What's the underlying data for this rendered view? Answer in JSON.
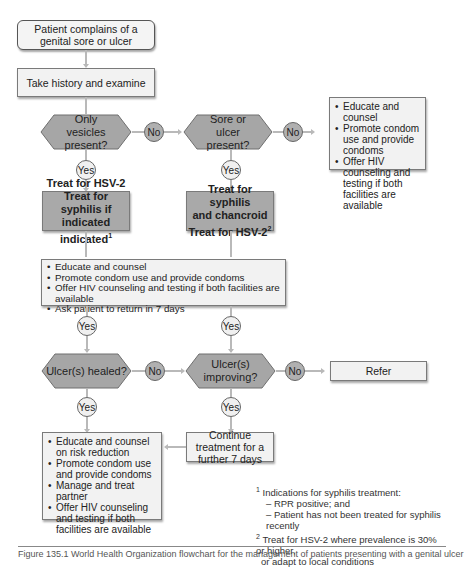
{
  "flowchart": {
    "start": "Patient complains of a genital sore or ulcer",
    "history": "Take history and examine",
    "decision_vesicles": "Only vesicles present?",
    "decision_sore": "Sore or ulcer present?",
    "no_sore_actions": [
      "Educate and counsel",
      "Promote condom use and provide condoms",
      "Offer HIV counseling and testing if both facilities are available"
    ],
    "treat_hsv_lines": [
      "Treat for HSV-2",
      "Treat for syphilis if indicated"
    ],
    "treat_hsv_sup": "1",
    "treat_syph_lines": [
      "Treat for syphilis",
      "and chancroid",
      "Treat for HSV-2"
    ],
    "treat_syph_sup": "2",
    "common_actions": [
      "Educate and counsel",
      "Promote condom use and provide condoms",
      "Offer HIV counseling and testing if both facilities are available",
      "Ask patient to return in 7 days"
    ],
    "decision_healed": "Ulcer(s) healed?",
    "decision_improving": "Ulcer(s) improving?",
    "refer": "Refer",
    "continue": "Continue treatment for a further 7 days",
    "healed_actions": [
      "Educate and counsel on risk reduction",
      "Promote condom use and provide condoms",
      "Manage and treat partner",
      "Offer HIV counseling and testing if both facilities are available"
    ],
    "labels": {
      "yes": "Yes",
      "no": "No"
    }
  },
  "footnotes": {
    "n1_mark": "1",
    "n1_title": "Indications for syphilis treatment:",
    "n1_items": [
      "– RPR positive; and",
      "– Patient has not been treated for syphilis recently"
    ],
    "n2_mark": "2",
    "n2_line1": "Treat for HSV-2 where prevalence is 30% or higher,",
    "n2_line2": "or adapt to local conditions"
  },
  "caption": "Figure 135.1 World Health Organization flowchart for the management of patients presenting with a genital ulcer"
}
